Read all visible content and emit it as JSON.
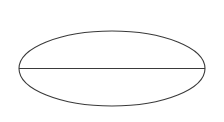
{
  "figure": {
    "kind": "geometry-diagram",
    "canvas": {
      "width": 224,
      "height": 122,
      "background_color": "#ffffff"
    },
    "stroke": {
      "color": "#3a3a3a",
      "width": 1.1
    },
    "shapes": [
      {
        "name": "ellipse",
        "type": "ellipse",
        "center_x": 112,
        "center_y": 68.5,
        "radius_x": 93,
        "radius_y": 37.5,
        "fill": "none",
        "stroke_color": "#3a3a3a"
      },
      {
        "name": "major-axis",
        "type": "line",
        "x1": 19,
        "y1": 68.5,
        "x2": 205,
        "y2": 68.5,
        "stroke_color": "#3a3a3a"
      }
    ],
    "labels": [],
    "annotations": []
  }
}
